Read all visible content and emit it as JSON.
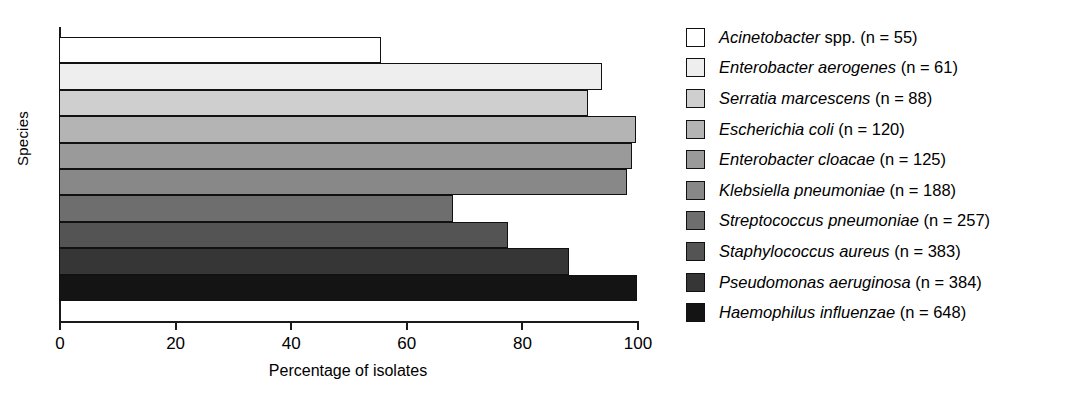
{
  "chart_data": {
    "type": "bar",
    "orientation": "horizontal",
    "title": "",
    "xlabel": "Percentage of isolates",
    "ylabel": "Species",
    "xlim": [
      0,
      100
    ],
    "xticks": [
      0,
      20,
      40,
      60,
      80,
      100
    ],
    "xtick_labels": [
      "0",
      "20",
      "40",
      "60",
      "80",
      "100"
    ],
    "grid": false,
    "legend_position": "right",
    "categories": [
      "Acinetobacter spp. (n = 55)",
      "Enterobacter aerogenes (n = 61)",
      "Serratia marcescens (n = 88)",
      "Escherichia coli (n = 120)",
      "Enterobacter cloacae (n = 125)",
      "Klebsiella pneumoniae (n = 188)",
      "Streptococcus pneumoniae (n = 257)",
      "Staphylococcus aureus (n = 383)",
      "Pseudomonas aeruginosa (n = 384)",
      "Haemophilus influenzae (n = 648)"
    ],
    "values": [
      55.7,
      94.0,
      91.6,
      99.8,
      99.2,
      98.2,
      68.2,
      77.7,
      88.3,
      100.0
    ],
    "colors": [
      "#ffffff",
      "#eeeeee",
      "#cfcfcf",
      "#b4b4b4",
      "#9a9a9a",
      "#888888",
      "#6e6e6e",
      "#545454",
      "#363636",
      "#141414"
    ],
    "bar_edge_color": "#111111"
  },
  "axes": {
    "y_title": "Species",
    "x_title": "Percentage of isolates",
    "x_tick_labels": [
      "0",
      "20",
      "40",
      "60",
      "80",
      "100"
    ]
  },
  "legend": {
    "items": [
      {
        "genus": "Acinetobacter",
        "rest": "spp. (n = 55)",
        "swatch": "#ffffff"
      },
      {
        "genus": "Enterobacter aerogenes",
        "rest": "(n = 61)",
        "swatch": "#eeeeee"
      },
      {
        "genus": "Serratia marcescens",
        "rest": "(n = 88)",
        "swatch": "#cfcfcf"
      },
      {
        "genus": "Escherichia coli",
        "rest": "(n = 120)",
        "swatch": "#b4b4b4"
      },
      {
        "genus": "Enterobacter cloacae",
        "rest": "(n = 125)",
        "swatch": "#9a9a9a"
      },
      {
        "genus": "Klebsiella pneumoniae",
        "rest": "(n = 188)",
        "swatch": "#888888"
      },
      {
        "genus": "Streptococcus pneumoniae",
        "rest": "(n = 257)",
        "swatch": "#6e6e6e"
      },
      {
        "genus": "Staphylococcus aureus",
        "rest": "(n = 383)",
        "swatch": "#545454"
      },
      {
        "genus": "Pseudomonas aeruginosa",
        "rest": "(n = 384)",
        "swatch": "#363636"
      },
      {
        "genus": "Haemophilus influenzae",
        "rest": "(n = 648)",
        "swatch": "#141414"
      }
    ]
  }
}
